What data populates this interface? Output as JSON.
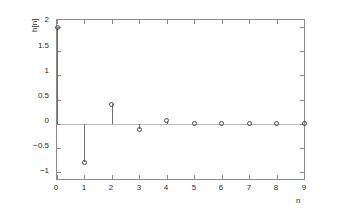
{
  "chart_data": {
    "type": "scatter",
    "plot_style": "stem",
    "title": "",
    "xlabel": "n",
    "ylabel": "h[n]",
    "x": [
      0,
      1,
      2,
      3,
      4,
      5,
      6,
      7,
      8,
      9
    ],
    "values": [
      2,
      -0.8,
      0.4,
      -0.12,
      0.06,
      0.01,
      0.005,
      0.002,
      0.001,
      0.0
    ],
    "series": [
      {
        "name": "h[n]",
        "values": [
          2,
          -0.8,
          0.4,
          -0.12,
          0.06,
          0.01,
          0.005,
          0.002,
          0.001,
          0.0
        ]
      }
    ],
    "xlim": [
      0,
      9
    ],
    "ylim": [
      -1.15,
      2.15
    ],
    "xticks": [
      0,
      1,
      2,
      3,
      4,
      5,
      6,
      7,
      8,
      9
    ],
    "xtick_labels": [
      "0",
      "1",
      "2",
      "3",
      "4",
      "5",
      "6",
      "7",
      "8",
      "9"
    ],
    "yticks": [
      2,
      1.5,
      1,
      0.5,
      0,
      -0.5,
      -1
    ],
    "ytick_labels": [
      "2",
      "1.5",
      "1",
      "0.5",
      "0",
      "−0.5",
      "−1"
    ],
    "grid": false,
    "legend": null,
    "legend_position": "none",
    "baseline": 0,
    "marker": "circle-open",
    "colors": {
      "axis": "#8a8a8a",
      "marker": "#4a4a4a",
      "stem": "#6f6f6f",
      "baseline": "#b9b9b9",
      "text": "#2b2b2b",
      "background": "#ffffff"
    }
  }
}
